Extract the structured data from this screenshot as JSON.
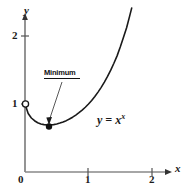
{
  "figure": {
    "background_color": "#ffffff",
    "stroke_color": "#1a1a1a",
    "axis_color": "#555555"
  },
  "axes": {
    "x": {
      "label": "x",
      "ticks": [
        "0",
        "1",
        "2"
      ],
      "tick_values": [
        0,
        1,
        2
      ],
      "range": [
        0,
        2.35
      ]
    },
    "y": {
      "label": "y",
      "ticks": [
        "1",
        "2"
      ],
      "tick_values": [
        1,
        2
      ],
      "range": [
        0,
        2.4
      ]
    }
  },
  "annotations": {
    "minimum": {
      "label": "Minimum",
      "point": [
        0.37,
        0.69
      ],
      "marker": "filled-dot",
      "underlined": true
    },
    "endpoint": {
      "point": [
        0,
        1
      ],
      "marker": "open-circle"
    },
    "equation": {
      "base": "y = x",
      "exponent": "x",
      "full": "y = x^x"
    }
  },
  "chart_data": {
    "type": "line",
    "title": "",
    "xlabel": "x",
    "ylabel": "y",
    "xlim": [
      0,
      2.35
    ],
    "ylim": [
      0,
      2.4
    ],
    "xticks": [
      0,
      1,
      2
    ],
    "yticks": [
      1,
      2
    ],
    "grid": false,
    "legend": null,
    "series": [
      {
        "name": "y = x^x",
        "x": [
          0.0,
          0.05,
          0.1,
          0.15,
          0.2,
          0.25,
          0.3,
          0.35,
          0.3679,
          0.4,
          0.45,
          0.5,
          0.55,
          0.6,
          0.65,
          0.7,
          0.75,
          0.8,
          0.85,
          0.9,
          0.95,
          1.0,
          1.05,
          1.1,
          1.15,
          1.2,
          1.25,
          1.3,
          1.35,
          1.4,
          1.45,
          1.5,
          1.55,
          1.6,
          1.65,
          1.68
        ],
        "y": [
          1.0,
          0.861,
          0.794,
          0.754,
          0.725,
          0.707,
          0.697,
          0.692,
          0.6922,
          0.693,
          0.697,
          0.707,
          0.72,
          0.736,
          0.755,
          0.779,
          0.806,
          0.837,
          0.872,
          0.91,
          0.952,
          1.0,
          1.052,
          1.11,
          1.175,
          1.245,
          1.322,
          1.406,
          1.498,
          1.599,
          1.708,
          1.837,
          1.977,
          2.121,
          2.3,
          2.41
        ]
      }
    ],
    "markers": [
      {
        "name": "open-circle-endpoint",
        "x": 0,
        "y": 1,
        "style": "open"
      },
      {
        "name": "minimum-point",
        "x": 0.3679,
        "y": 0.6922,
        "style": "filled"
      }
    ],
    "annotations": [
      {
        "text": "Minimum",
        "target_x": 0.3679,
        "target_y": 0.6922
      },
      {
        "text": "y = x^x",
        "x": 1.15,
        "y": 0.85
      }
    ]
  }
}
